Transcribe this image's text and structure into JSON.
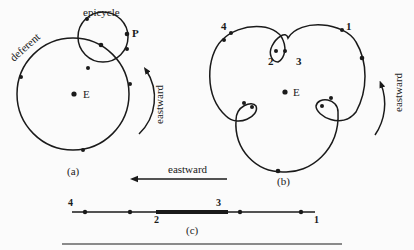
{
  "figure_a": {
    "label_epicycle": "epicycle",
    "label_deferent": "deferent",
    "label_planet": "P",
    "label_earth": "E",
    "label_direction": "eastward",
    "caption": "(a)"
  },
  "figure_b": {
    "point_1": "1",
    "point_2": "2",
    "point_3": "3",
    "point_4": "4",
    "label_earth": "E",
    "label_direction": "eastward",
    "caption": "(b)"
  },
  "figure_c": {
    "label_direction": "eastward",
    "point_1": "1",
    "point_2": "2",
    "point_3": "3",
    "point_4": "4",
    "caption": "(c)"
  },
  "colors": {
    "ink": "#1a1a1a",
    "background": "#fbfbfb"
  }
}
